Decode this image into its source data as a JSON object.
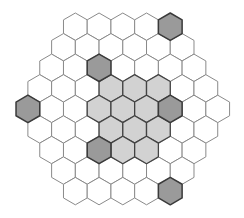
{
  "board": {
    "shape": "hexagon",
    "orientation": "pointy-top",
    "side_length_cells": 5,
    "row_counts": [
      5,
      6,
      7,
      8,
      9,
      8,
      7,
      6,
      5
    ],
    "geometry": {
      "center_x": 122.8,
      "first_row_center_y": 26.7,
      "hex_radius": 13.7
    },
    "colors": {
      "white": "#ffffff",
      "light": "#d2d2d2",
      "dark": "#9a9a9a",
      "border": "#8a8a8a"
    },
    "shaded_cells": [
      {
        "row": 0,
        "col": 4,
        "shade": "dark"
      },
      {
        "row": 2,
        "col": 2,
        "shade": "dark"
      },
      {
        "row": 3,
        "col": 3,
        "shade": "light"
      },
      {
        "row": 3,
        "col": 4,
        "shade": "light"
      },
      {
        "row": 3,
        "col": 5,
        "shade": "light"
      },
      {
        "row": 4,
        "col": 0,
        "shade": "dark"
      },
      {
        "row": 4,
        "col": 3,
        "shade": "light"
      },
      {
        "row": 4,
        "col": 4,
        "shade": "light"
      },
      {
        "row": 4,
        "col": 5,
        "shade": "light"
      },
      {
        "row": 4,
        "col": 6,
        "shade": "dark"
      },
      {
        "row": 5,
        "col": 3,
        "shade": "light"
      },
      {
        "row": 5,
        "col": 4,
        "shade": "light"
      },
      {
        "row": 5,
        "col": 5,
        "shade": "light"
      },
      {
        "row": 6,
        "col": 2,
        "shade": "dark"
      },
      {
        "row": 6,
        "col": 3,
        "shade": "light"
      },
      {
        "row": 6,
        "col": 4,
        "shade": "light"
      },
      {
        "row": 8,
        "col": 4,
        "shade": "dark"
      }
    ]
  }
}
